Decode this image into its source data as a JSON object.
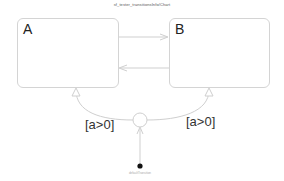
{
  "chart": {
    "title": "sf_tester_transitionsInfo/Chart"
  },
  "states": [
    {
      "id": "A",
      "label": "A"
    },
    {
      "id": "B",
      "label": "B"
    }
  ],
  "transitions": [
    {
      "from": "A",
      "to": "B",
      "label": ""
    },
    {
      "from": "B",
      "to": "A",
      "label": ""
    },
    {
      "from": "junction",
      "to": "A",
      "label": "[a>0]"
    },
    {
      "from": "junction",
      "to": "B",
      "label": "[a>0]"
    },
    {
      "from": "default",
      "to": "junction",
      "label": ""
    }
  ],
  "default_transition": {
    "caption": "defaultTransition"
  },
  "colors": {
    "state_border": "#d4d4d4",
    "transition": "#cfcfcf",
    "default_dot": "#111111"
  }
}
